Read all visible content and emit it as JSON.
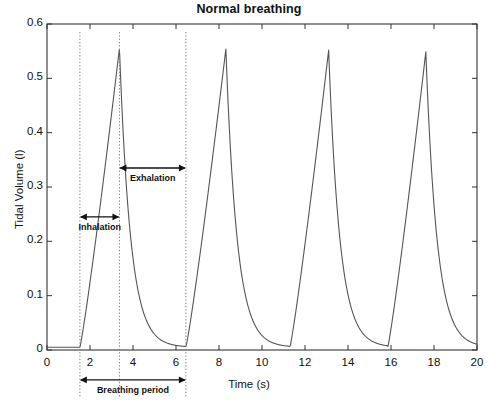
{
  "chart_data": {
    "type": "line",
    "title": "Normal breathing",
    "xlabel": "Time (s)",
    "ylabel": "Tidal Volume (l)",
    "xlim": [
      0,
      20
    ],
    "ylim": [
      0,
      0.6
    ],
    "xticks": [
      "0",
      "2",
      "4",
      "6",
      "8",
      "10",
      "12",
      "14",
      "16",
      "18",
      "20"
    ],
    "xtick_values": [
      0,
      2,
      4,
      6,
      8,
      10,
      12,
      14,
      16,
      18,
      20
    ],
    "yticks": [
      "0",
      "0.1",
      "0.2",
      "0.3",
      "0.4",
      "0.5",
      "0.6"
    ],
    "ytick_values": [
      0,
      0.1,
      0.2,
      0.3,
      0.4,
      0.5,
      0.6
    ],
    "grid": false,
    "legend": null,
    "series": [
      {
        "name": "Tidal volume",
        "description": "Four breathing cycles: slow linear inhalation ramp to peak, then rapid exponential exhalation decay back to baseline.",
        "breath_peaks_t": [
          3.37,
          8.32,
          13.1,
          17.62
        ],
        "breath_peaks_v": [
          0.556,
          0.554,
          0.552,
          0.549
        ],
        "breath_onsets_t": [
          1.53,
          6.46,
          11.3,
          15.85
        ],
        "breath_period_s": 4.9,
        "inhalation_duration_s": 1.84,
        "exhalation_duration_s": 3.06,
        "baseline_v": 0.005
      }
    ],
    "guide_lines_t": [
      1.53,
      3.37,
      6.46
    ],
    "annotations": [
      {
        "label": "Inhalation",
        "t_start": 1.53,
        "t_end": 3.37,
        "v": 0.245,
        "style": "double-arrow"
      },
      {
        "label": "Exhalation",
        "t_start": 3.37,
        "t_end": 6.46,
        "v": 0.335,
        "style": "double-arrow"
      },
      {
        "label": "Breathing period",
        "t_start": 1.53,
        "t_end": 6.46,
        "v": -0.055,
        "style": "double-arrow"
      }
    ]
  },
  "colors": {
    "axis": "#333333",
    "line": "#555555",
    "guide": "#777777",
    "annotation": "#111111",
    "background": "#ffffff"
  }
}
